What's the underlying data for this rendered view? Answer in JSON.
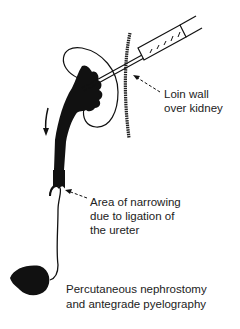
{
  "figure": {
    "title": "Percutaneous nephrostomy and antegrade pyelography",
    "labels": {
      "loin_wall": [
        "Loin wall",
        "over kidney"
      ],
      "narrowing": [
        "Area of narrowing",
        "due to ligation of",
        "the ureter"
      ]
    },
    "caption": [
      "Percutaneous nephrostomy",
      "and antegrade pyelography"
    ],
    "elements": [
      "kidney-outline",
      "renal-pelvis-contrast",
      "syringe-needle",
      "loin-wall",
      "ureter",
      "bladder",
      "flow-arrow"
    ],
    "colors": {
      "ink": "#111111",
      "background": "#ffffff"
    }
  }
}
